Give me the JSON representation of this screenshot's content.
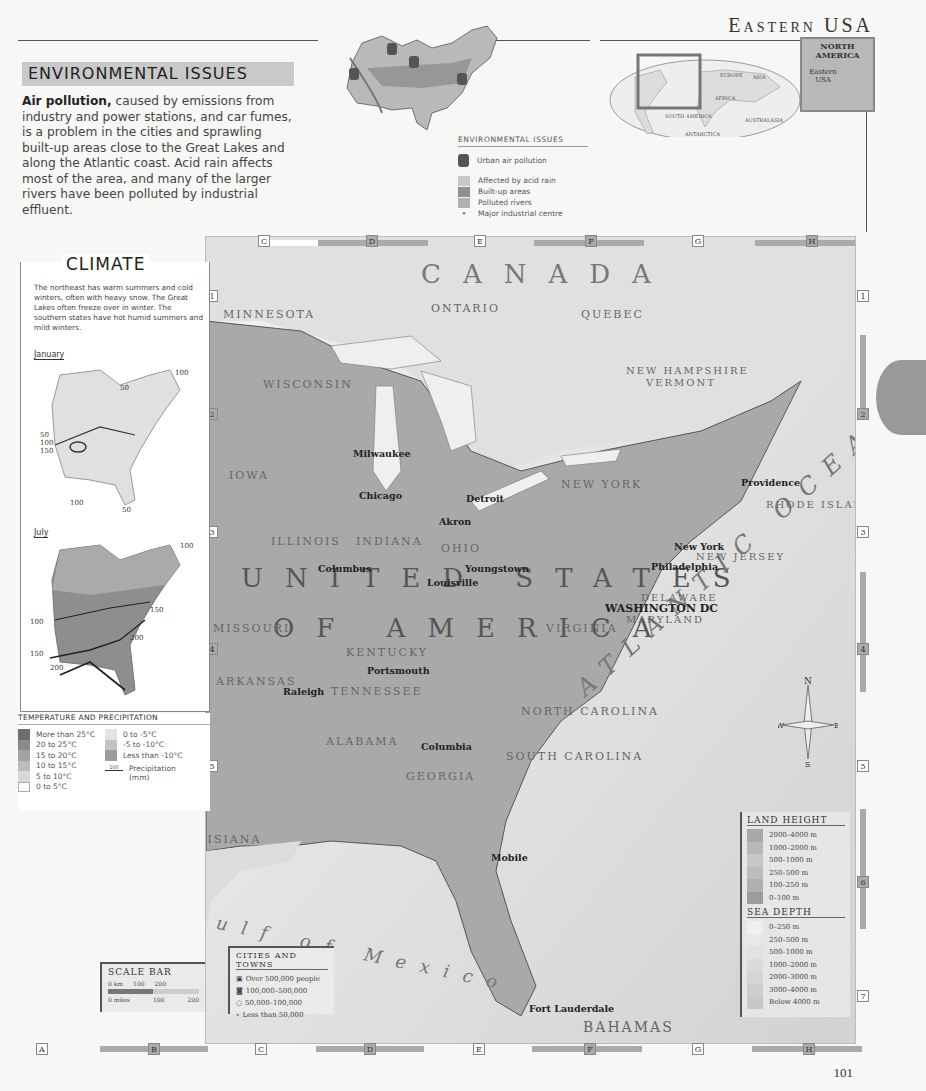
{
  "header": {
    "page_title": "Eastern USA",
    "page_number": "101"
  },
  "environmental_issues": {
    "heading": "ENVIRONMENTAL ISSUES",
    "lead_bold": "Air pollution,",
    "body": " caused by emissions from industry and power stations, and car fumes, is a problem in the cities and sprawling built-up areas close to the Great Lakes and along the Atlantic coast. Acid rain affects most of the area, and many of the larger rivers have been polluted by industrial effluent.",
    "inset_labels": [
      "Chicago",
      "Detroit",
      "Cleveland",
      "Ohio River",
      "Hudson River",
      "New York",
      "Mississippi River",
      "Alabama River",
      "Roanoke River",
      "Savannah River"
    ],
    "legend": {
      "title": "ENVIRONMENTAL ISSUES",
      "items": [
        {
          "label": "Urban air pollution",
          "icon": "gas-mask-icon"
        },
        {
          "label": "Affected by acid rain",
          "color": "#c8c8c8"
        },
        {
          "label": "Built-up areas",
          "color": "#8f8f8f"
        },
        {
          "label": "Polluted rivers",
          "color": "#b0b0b0"
        },
        {
          "label": "Major industrial centre",
          "icon": "dot-icon"
        }
      ]
    }
  },
  "locator": {
    "world_labels": [
      "EUROPE",
      "ASIA",
      "AFRICA",
      "SOUTH AMERICA",
      "AUSTRALASIA AND OCEANIA",
      "ANTARCTICA"
    ],
    "inset_title": "NORTH AMERICA",
    "inset_region": "Eastern USA"
  },
  "climate": {
    "title": "CLIMATE",
    "text": "The northeast has warm summers and cold winters, often with heavy snow. The Great Lakes often freeze over in winter. The southern states have hot humid summers and mild winters.",
    "january": {
      "label": "January",
      "isohyets": [
        "100",
        "50",
        "50",
        "100",
        "100",
        "50",
        "100",
        "150",
        "100",
        "50"
      ]
    },
    "july": {
      "label": "July",
      "isohyets": [
        "100",
        "100",
        "100",
        "100",
        "150",
        "200",
        "100",
        "150",
        "200"
      ]
    },
    "legend": {
      "title": "TEMPERATURE AND PRECIPITATION",
      "temps_warm": [
        {
          "label": "More than 25°C",
          "color": "#6e6e6e"
        },
        {
          "label": "20 to 25°C",
          "color": "#8a8a8a"
        },
        {
          "label": "15 to 20°C",
          "color": "#a3a3a3"
        },
        {
          "label": "10 to 15°C",
          "color": "#bcbcbc"
        },
        {
          "label": "5 to 10°C",
          "color": "#d8d8d8"
        },
        {
          "label": "0 to 5°C",
          "color": "#ffffff"
        }
      ],
      "temps_cold": [
        {
          "label": "0 to -5°C",
          "color": "#e3e3e3"
        },
        {
          "label": "-5 to -10°C",
          "color": "#c3c3c3"
        },
        {
          "label": "Less than -10°C",
          "color": "#9d9d9d"
        }
      ],
      "precip_sample": "100",
      "precip_label": "Precipitation (mm)"
    }
  },
  "grid": {
    "columns": [
      "A",
      "B",
      "C",
      "D",
      "E",
      "F",
      "G",
      "H"
    ],
    "rows": [
      "1",
      "2",
      "3",
      "4",
      "5",
      "6",
      "7"
    ]
  },
  "main_map": {
    "countries": [
      {
        "name": "CANADA",
        "x": 420,
        "y": 268
      },
      {
        "name": "UNITED STATES",
        "x": 240,
        "y": 575
      },
      {
        "name": "OF AMERICA",
        "x": 272,
        "y": 625
      },
      {
        "name": "MEXICO",
        "x": 2,
        "y": 1000
      },
      {
        "name": "BAHAMAS",
        "x": 582,
        "y": 1020
      }
    ],
    "provinces_states": [
      {
        "name": "ONTARIO",
        "x": 430,
        "y": 307
      },
      {
        "name": "QUEBEC",
        "x": 580,
        "y": 310
      },
      {
        "name": "NEW BRUNSWICK",
        "x": 790,
        "y": 315
      },
      {
        "name": "MINNESOTA",
        "x": 222,
        "y": 313
      },
      {
        "name": "WISCONSIN",
        "x": 264,
        "y": 383
      },
      {
        "name": "MICHIGAN",
        "x": 360,
        "y": 350
      },
      {
        "name": "IOWA",
        "x": 228,
        "y": 474
      },
      {
        "name": "ILLINOIS",
        "x": 270,
        "y": 540
      },
      {
        "name": "INDIANA",
        "x": 355,
        "y": 540
      },
      {
        "name": "OHIO",
        "x": 440,
        "y": 547
      },
      {
        "name": "PENNSYLVANIA",
        "x": 470,
        "y": 501
      },
      {
        "name": "NEW YORK",
        "x": 560,
        "y": 483
      },
      {
        "name": "NEW HAMPSHIRE",
        "x": 625,
        "y": 370
      },
      {
        "name": "VERMONT",
        "x": 645,
        "y": 382
      },
      {
        "name": "MAINE",
        "x": 760,
        "y": 393
      },
      {
        "name": "MASS.",
        "x": 690,
        "y": 480
      },
      {
        "name": "CONN.",
        "x": 685,
        "y": 497
      },
      {
        "name": "RHODE ISLAND",
        "x": 765,
        "y": 503
      },
      {
        "name": "NEW JERSEY",
        "x": 695,
        "y": 556
      },
      {
        "name": "DELAWARE",
        "x": 640,
        "y": 597
      },
      {
        "name": "MARYLAND",
        "x": 625,
        "y": 620
      },
      {
        "name": "WEST VIRGINIA",
        "x": 480,
        "y": 582
      },
      {
        "name": "VIRGINIA",
        "x": 545,
        "y": 627
      },
      {
        "name": "MISSOURI",
        "x": 212,
        "y": 627
      },
      {
        "name": "KENTUCKY",
        "x": 345,
        "y": 651
      },
      {
        "name": "TENNESSEE",
        "x": 330,
        "y": 690
      },
      {
        "name": "NORTH CAROLINA",
        "x": 520,
        "y": 710
      },
      {
        "name": "SOUTH CAROLINA",
        "x": 505,
        "y": 755
      },
      {
        "name": "ARKANSAS",
        "x": 215,
        "y": 680
      },
      {
        "name": "MISSISSIPPI",
        "x": 245,
        "y": 760
      },
      {
        "name": "ALABAMA",
        "x": 325,
        "y": 740
      },
      {
        "name": "GEORGIA",
        "x": 405,
        "y": 775
      },
      {
        "name": "LOUISIANA",
        "x": 175,
        "y": 838
      },
      {
        "name": "TEXAS",
        "x": 28,
        "y": 858
      },
      {
        "name": "FLORIDA",
        "x": 440,
        "y": 870
      }
    ],
    "major_cities": [
      {
        "name": "Milwaukee",
        "x": 352,
        "y": 453
      },
      {
        "name": "Grand Rapids",
        "x": 370,
        "y": 465
      },
      {
        "name": "Lansing",
        "x": 408,
        "y": 470
      },
      {
        "name": "Flint",
        "x": 453,
        "y": 465
      },
      {
        "name": "Chicago",
        "x": 358,
        "y": 495
      },
      {
        "name": "Ann Arbor",
        "x": 403,
        "y": 500
      },
      {
        "name": "Detroit",
        "x": 465,
        "y": 498
      },
      {
        "name": "Livonia",
        "x": 418,
        "y": 484
      },
      {
        "name": "Warren",
        "x": 460,
        "y": 488
      },
      {
        "name": "Toledo",
        "x": 452,
        "y": 510
      },
      {
        "name": "South Bend",
        "x": 391,
        "y": 514
      },
      {
        "name": "Gary",
        "x": 362,
        "y": 518
      },
      {
        "name": "Cleveland",
        "x": 438,
        "y": 521
      },
      {
        "name": "Akron",
        "x": 465,
        "y": 531
      },
      {
        "name": "Fort Wayne",
        "x": 357,
        "y": 530
      },
      {
        "name": "Peoria",
        "x": 217,
        "y": 527
      },
      {
        "name": "Rockford",
        "x": 278,
        "y": 480
      },
      {
        "name": "Madison",
        "x": 279,
        "y": 450
      },
      {
        "name": "Indianapolis",
        "x": 317,
        "y": 568
      },
      {
        "name": "Dayton",
        "x": 394,
        "y": 570
      },
      {
        "name": "Columbus",
        "x": 464,
        "y": 568
      },
      {
        "name": "Pittsburgh",
        "x": 485,
        "y": 554
      },
      {
        "name": "Youngstown",
        "x": 524,
        "y": 534
      },
      {
        "name": "Cincinnati",
        "x": 426,
        "y": 582
      },
      {
        "name": "Evansville",
        "x": 298,
        "y": 615
      },
      {
        "name": "Louisville",
        "x": 370,
        "y": 619
      },
      {
        "name": "Lexington",
        "x": 425,
        "y": 625
      },
      {
        "name": "Buffalo",
        "x": 522,
        "y": 477
      },
      {
        "name": "Erie",
        "x": 530,
        "y": 505
      },
      {
        "name": "Syracuse",
        "x": 580,
        "y": 460
      },
      {
        "name": "Rochester",
        "x": 620,
        "y": 461
      },
      {
        "name": "Albany",
        "x": 640,
        "y": 479
      },
      {
        "name": "Boston",
        "x": 740,
        "y": 482
      },
      {
        "name": "Providence",
        "x": 736,
        "y": 494
      },
      {
        "name": "Hartford",
        "x": 705,
        "y": 510
      },
      {
        "name": "New Haven",
        "x": 646,
        "y": 512
      },
      {
        "name": "Stamford",
        "x": 652,
        "y": 520
      },
      {
        "name": "Bridgeport",
        "x": 695,
        "y": 527
      },
      {
        "name": "Paterson",
        "x": 626,
        "y": 528
      },
      {
        "name": "Newark",
        "x": 628,
        "y": 537
      },
      {
        "name": "New York",
        "x": 673,
        "y": 546
      },
      {
        "name": "Allentown",
        "x": 592,
        "y": 541
      },
      {
        "name": "Philadelphia",
        "x": 650,
        "y": 566
      },
      {
        "name": "Baltimore",
        "x": 585,
        "y": 578
      },
      {
        "name": "Arlington",
        "x": 556,
        "y": 604
      },
      {
        "name": "WASHINGTON DC",
        "x": 604,
        "y": 607
      },
      {
        "name": "Richmond",
        "x": 597,
        "y": 642
      },
      {
        "name": "Norfolk",
        "x": 630,
        "y": 650
      },
      {
        "name": "Newport News",
        "x": 550,
        "y": 655
      },
      {
        "name": "Virginia Beach",
        "x": 636,
        "y": 660
      },
      {
        "name": "Portsmouth",
        "x": 622,
        "y": 669
      },
      {
        "name": "Nashville",
        "x": 366,
        "y": 670
      },
      {
        "name": "Knoxville",
        "x": 414,
        "y": 678
      },
      {
        "name": "Roanoke",
        "x": 493,
        "y": 656
      },
      {
        "name": "Winston Salem",
        "x": 492,
        "y": 670
      },
      {
        "name": "Greensboro",
        "x": 535,
        "y": 677
      },
      {
        "name": "Durham",
        "x": 565,
        "y": 686
      },
      {
        "name": "Raleigh",
        "x": 570,
        "y": 695
      },
      {
        "name": "Memphis",
        "x": 282,
        "y": 691
      },
      {
        "name": "Chattanooga",
        "x": 338,
        "y": 705
      },
      {
        "name": "Charlotte",
        "x": 513,
        "y": 719
      },
      {
        "name": "Huntsville",
        "x": 365,
        "y": 728
      },
      {
        "name": "Columbia",
        "x": 505,
        "y": 741
      },
      {
        "name": "Birmingham",
        "x": 298,
        "y": 750
      },
      {
        "name": "Atlanta",
        "x": 420,
        "y": 746
      },
      {
        "name": "Jackson",
        "x": 270,
        "y": 780
      },
      {
        "name": "Montgomery",
        "x": 340,
        "y": 785
      },
      {
        "name": "Macon",
        "x": 436,
        "y": 785
      },
      {
        "name": "Columbus",
        "x": 402,
        "y": 800
      },
      {
        "name": "Savannah",
        "x": 505,
        "y": 815
      },
      {
        "name": "Mobile",
        "x": 288,
        "y": 835
      },
      {
        "name": "Jacksonville",
        "x": 490,
        "y": 857
      },
      {
        "name": "Orlando",
        "x": 496,
        "y": 910
      },
      {
        "name": "Tampa",
        "x": 470,
        "y": 932
      },
      {
        "name": "Saint Petersburg",
        "x": 453,
        "y": 943
      },
      {
        "name": "Fort Lauderdale",
        "x": 530,
        "y": 988
      },
      {
        "name": "Miami",
        "x": 528,
        "y": 1008
      }
    ],
    "minor_places": [
      "Lake of the Woods",
      "Rainy Lake",
      "Isle Royale",
      "Lake Superior",
      "Apostle Islands",
      "Superior",
      "Houghton",
      "Sault Sainte Marie",
      "Georgian Bay",
      "Lake Huron",
      "Lake Michigan",
      "Great Lakes",
      "Rhinelander",
      "Eau Claire",
      "Green Bay",
      "Appleton",
      "Oshkosh",
      "La Crosse",
      "Roscommon",
      "Saginaw Bay",
      "Saginaw",
      "Waukesha",
      "Racine",
      "Kalamazoo",
      "Elgin",
      "Aurora",
      "Joliet",
      "Janesville",
      "Lake Erie",
      "Lake Ontario",
      "Niagara Falls",
      "Lake Champlain",
      "Adirondack Mountains",
      "Catskill Mountains",
      "Binghamton",
      "Scranton",
      "Allegheny Plateau",
      "Reading",
      "Harrisburg",
      "Lancaster",
      "Wilmington",
      "Trenton",
      "Vineland",
      "Dover",
      "Annapolis",
      "Chesapeake Bay",
      "Long Island",
      "Long Island Sound",
      "Portland",
      "Manchester",
      "Concord",
      "Montpelier",
      "Berlin",
      "Mount Washington",
      "Bangor",
      "Houlton",
      "Mount Katahdin",
      "Moosehead Lake",
      "Saint John",
      "Bay of Fundy",
      "Gulf of Maine",
      "Mansfield",
      "Canton",
      "Warren",
      "Altoona",
      "Champaign",
      "Springfield",
      "Decatur",
      "Terre Haute",
      "Bloomington",
      "Anderson",
      "Muncie",
      "East Saint Louis",
      "Missouri River",
      "Mississippi River",
      "Owensboro",
      "Frankfort",
      "Huntington",
      "Charleston",
      "Spruce Knob",
      "Clarksville",
      "Kentucky Lake",
      "Lake Cumberland",
      "Norris Lake",
      "Mount Mitchell",
      "Asheville",
      "Greenville",
      "Clark Hill Lake",
      "Brasstown Bald",
      "Corinth",
      "Clarksdale",
      "Tuscaloosa",
      "Natchez",
      "Hattiesburg",
      "Gulfport",
      "Pensacola",
      "Tallahassee",
      "Albany",
      "Waycross",
      "Lake Seminole",
      "Apalachee Bay",
      "Fayetteville",
      "High Point",
      "Cape Hatteras",
      "Pamlico Sound",
      "Onslow Bay",
      "Cape Fear",
      "Long Bay",
      "Charleston",
      "Daytona Beach",
      "Cape Canaveral",
      "Lake Kissimmee",
      "Lakeland",
      "Clearwater",
      "Largo",
      "Lake Okeechobee",
      "Charlotte Harbor",
      "Big Cypress Swamp",
      "West Palm Beach",
      "Miami Beach",
      "Key Largo",
      "Florida Keys",
      "Key West",
      "Straits of Florida",
      "Mississippi Delta",
      "Rio Grande",
      "Appalachian Mountains"
    ],
    "water_labels": [
      {
        "name": "ATLANTIC OCEAN"
      },
      {
        "name": "Gulf of Mexico"
      }
    ],
    "compass": [
      "N",
      "E",
      "S",
      "W"
    ]
  },
  "scale_bar": {
    "title": "SCALE BAR",
    "km_labels": [
      "0 km",
      "100",
      "200"
    ],
    "mile_labels": [
      "0 miles",
      "100",
      "200"
    ]
  },
  "cities_legend": {
    "title": "CITIES AND TOWNS",
    "items": [
      "Over 500,000 people",
      "100,000–500,000",
      "50,000–100,000",
      "Less than 50,000"
    ]
  },
  "land_height": {
    "title": "LAND HEIGHT",
    "items": [
      {
        "label": "2000–4000 m",
        "color": "#a8a8a8"
      },
      {
        "label": "1000–2000 m",
        "color": "#b8b8b8"
      },
      {
        "label": "500–1000 m",
        "color": "#c8c8c8"
      },
      {
        "label": "250–500 m",
        "color": "#bdbdbd"
      },
      {
        "label": "100–250 m",
        "color": "#b0b0b0"
      },
      {
        "label": "0–100 m",
        "color": "#9c9c9c"
      }
    ]
  },
  "sea_depth": {
    "title": "SEA DEPTH",
    "items": [
      {
        "label": "0–250 m",
        "color": "#f0f0f0"
      },
      {
        "label": "250–500 m",
        "color": "#e8e8e8"
      },
      {
        "label": "500–1000 m",
        "color": "#e2e2e2"
      },
      {
        "label": "1000–2000 m",
        "color": "#dbdbdb"
      },
      {
        "label": "2000–3000 m",
        "color": "#d5d5d5"
      },
      {
        "label": "3000–4000 m",
        "color": "#cecece"
      },
      {
        "label": "Below 4000 m",
        "color": "#c8c8c8"
      }
    ]
  }
}
